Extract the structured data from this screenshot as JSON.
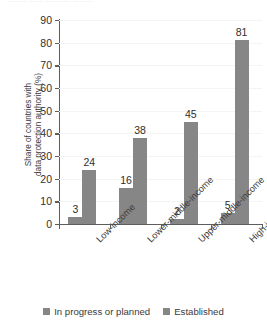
{
  "figure": {
    "title_remnant": "▁▁▁ ▁▁ ▁▁▁▁ ▁▁▁"
  },
  "chart_data": {
    "type": "bar",
    "title": "",
    "subtitle": "",
    "xlabel": "",
    "ylabel": "Share of countries with data protection authority (%)",
    "ylabel_line1": "Share of countries with",
    "ylabel_line2": "data protection authority (%)",
    "categories": [
      "Low-income",
      "Lower-middle-income",
      "Upper-middle-income",
      "High-income"
    ],
    "series": [
      {
        "name": "In progress or planned",
        "color": "#868686",
        "values": [
          3,
          16,
          2,
          5
        ]
      },
      {
        "name": "Established",
        "color": "#868686",
        "values": [
          24,
          38,
          45,
          81
        ]
      }
    ],
    "ylim": [
      0,
      90
    ],
    "yticks": [
      0,
      10,
      20,
      30,
      40,
      50,
      60,
      70,
      80,
      90
    ],
    "ytick_labels": [
      "0",
      "10",
      "20",
      "30",
      "40",
      "50",
      "60",
      "70",
      "80",
      "90"
    ],
    "grid": true,
    "grid_color": "#f4f4f4",
    "legend_position": "bottom",
    "data_labels": [
      [
        "3",
        "24"
      ],
      [
        "16",
        "38"
      ],
      [
        "2",
        "45"
      ],
      [
        "5",
        "81"
      ]
    ]
  }
}
